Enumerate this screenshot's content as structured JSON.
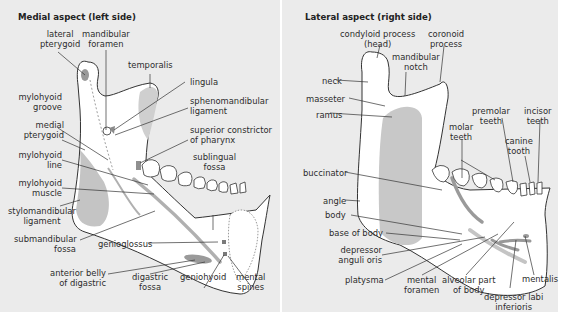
{
  "left": {
    "title": "Medial aspect (left side)",
    "labels": {
      "lateral_pterygoid": [
        "lateral",
        "pterygoid"
      ],
      "mandibular_foramen": [
        "mandibular",
        "foramen"
      ],
      "temporalis": "temporalis",
      "lingula": "lingula",
      "sphenomandibular_ligament": [
        "sphenomandibular",
        "ligament"
      ],
      "mylohyoid_groove": [
        "mylohyoid",
        "groove"
      ],
      "medial_pterygoid": [
        "medial",
        "pterygoid"
      ],
      "superior_constrictor": [
        "superior constrictor",
        "of pharynx"
      ],
      "mylohyoid_line": [
        "mylohyoid",
        "line"
      ],
      "sublingual_fossa": [
        "sublingual",
        "fossa"
      ],
      "mylohyoid_muscle": [
        "mylohyoid",
        "muscle"
      ],
      "stylomandibular_ligament": [
        "stylomandibular",
        "ligament"
      ],
      "submandibular_fossa": [
        "submandibular",
        "fossa"
      ],
      "genioglossus": "genioglossus",
      "anterior_belly_digastric": [
        "anterior belly",
        "of digastric"
      ],
      "digastric_fossa": [
        "digastric",
        "fossa"
      ],
      "geniohyoid": "geniohyoid",
      "mental_spines": [
        "mental",
        "spines"
      ]
    }
  },
  "right": {
    "title": "Lateral aspect (right side)",
    "labels": {
      "condyloid_process": [
        "condyloid process",
        "(head)"
      ],
      "coronoid_process": [
        "coronoid",
        "process"
      ],
      "mandibular_notch": [
        "mandibular",
        "notch"
      ],
      "neck": "neck",
      "masseter": "masseter",
      "ramus": "ramus",
      "premolar_teeth": [
        "premolar",
        "teeth"
      ],
      "incisor_teeth": [
        "incisor",
        "teeth"
      ],
      "molar_teeth": [
        "molar",
        "teeth"
      ],
      "canine_tooth": [
        "canine",
        "tooth"
      ],
      "buccinator": "buccinator",
      "angle": "angle",
      "body": "body",
      "base_of_body": "base of body",
      "depressor_anguli_oris": [
        "depressor",
        "anguli oris"
      ],
      "platysma": "platysma",
      "mental_foramen": [
        "mental",
        "foramen"
      ],
      "alveolar_part": [
        "alveolar part",
        "of body"
      ],
      "depressor_labi_inferioris": [
        "depressor labi",
        "inferioris"
      ],
      "mentalis": "mentalis"
    }
  },
  "colors": {
    "panel_bg": "#ebebeb",
    "bone": "#ffffff",
    "muscle_attachment": "#bdbdbd",
    "muscle_attachment_dark": "#8f8f8f",
    "outline": "#333333"
  }
}
